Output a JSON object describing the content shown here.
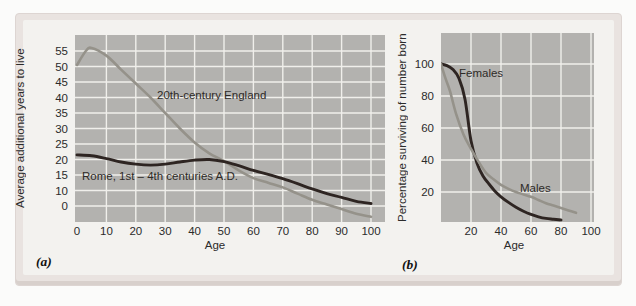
{
  "colors": {
    "plot_bg": "#b3b2af",
    "gridline": "#f0efeb",
    "frame": "#e9e3e0",
    "inner": "#f3f2ef",
    "text": "#2b2b2b",
    "dark_curve": "#2e2522",
    "light_curve": "#95928a"
  },
  "panels": [
    {
      "label": "(a)"
    },
    {
      "label": "(b)"
    }
  ],
  "chart_data": [
    {
      "type": "line",
      "panel": "a",
      "xlabel": "Age",
      "ylabel": "Average additional years to live",
      "x_ticks": [
        0,
        10,
        20,
        30,
        40,
        50,
        60,
        70,
        80,
        90,
        100
      ],
      "y_ticks": [
        55,
        50,
        45,
        40,
        35,
        30,
        25,
        20,
        15,
        10,
        0
      ],
      "xlim": [
        0,
        100
      ],
      "ylim": [
        0,
        58
      ],
      "grid": true,
      "series": [
        {
          "name": "20th-century England",
          "color": "#95928a",
          "points": [
            [
              0,
              50.5
            ],
            [
              3,
              55
            ],
            [
              5,
              56
            ],
            [
              10,
              53.5
            ],
            [
              15,
              49
            ],
            [
              20,
              44.5
            ],
            [
              25,
              40
            ],
            [
              30,
              35
            ],
            [
              35,
              30
            ],
            [
              40,
              25.5
            ],
            [
              45,
              22
            ],
            [
              50,
              19.5
            ],
            [
              55,
              16.5
            ],
            [
              60,
              14
            ],
            [
              65,
              12.5
            ],
            [
              70,
              11
            ],
            [
              75,
              9
            ],
            [
              80,
              7
            ],
            [
              85,
              5.5
            ],
            [
              90,
              4
            ],
            [
              95,
              2.5
            ],
            [
              100,
              1.5
            ]
          ]
        },
        {
          "name": "Rome, 1st – 4th centuries A.D.",
          "color": "#2e2522",
          "points": [
            [
              0,
              21.5
            ],
            [
              5,
              21.2
            ],
            [
              10,
              20.3
            ],
            [
              15,
              19.2
            ],
            [
              20,
              18.5
            ],
            [
              25,
              18.2
            ],
            [
              30,
              18.5
            ],
            [
              35,
              19.2
            ],
            [
              40,
              19.8
            ],
            [
              45,
              20
            ],
            [
              50,
              19.3
            ],
            [
              55,
              18
            ],
            [
              60,
              16.5
            ],
            [
              65,
              15.2
            ],
            [
              70,
              13.8
            ],
            [
              75,
              12.2
            ],
            [
              80,
              10.5
            ],
            [
              85,
              9
            ],
            [
              90,
              7.8
            ],
            [
              95,
              6.5
            ],
            [
              100,
              5.8
            ]
          ]
        }
      ]
    },
    {
      "type": "line",
      "panel": "b",
      "xlabel": "Age",
      "ylabel": "Percentage surviving of number born",
      "x_ticks": [
        20,
        40,
        60,
        80,
        100
      ],
      "y_ticks": [
        100,
        80,
        60,
        40,
        20
      ],
      "xlim": [
        0,
        100
      ],
      "ylim": [
        0,
        118
      ],
      "grid": true,
      "series": [
        {
          "name": "Females",
          "color": "#2e2522",
          "points": [
            [
              0,
              100
            ],
            [
              4,
              99
            ],
            [
              8,
              96.5
            ],
            [
              12,
              91
            ],
            [
              16,
              78
            ],
            [
              20,
              52
            ],
            [
              24,
              38
            ],
            [
              28,
              30
            ],
            [
              32,
              25
            ],
            [
              36,
              20.5
            ],
            [
              40,
              17
            ],
            [
              45,
              13.5
            ],
            [
              50,
              10.5
            ],
            [
              55,
              8
            ],
            [
              60,
              6
            ],
            [
              65,
              4.5
            ],
            [
              70,
              3.5
            ],
            [
              75,
              3
            ],
            [
              80,
              2.5
            ]
          ]
        },
        {
          "name": "Males",
          "color": "#95928a",
          "points": [
            [
              0,
              100
            ],
            [
              3,
              91
            ],
            [
              6,
              83
            ],
            [
              10,
              69
            ],
            [
              15,
              56
            ],
            [
              20,
              47
            ],
            [
              25,
              39
            ],
            [
              30,
              32
            ],
            [
              35,
              28
            ],
            [
              40,
              24.5
            ],
            [
              45,
              22
            ],
            [
              50,
              20
            ],
            [
              55,
              18.5
            ],
            [
              60,
              17
            ],
            [
              65,
              15
            ],
            [
              70,
              13
            ],
            [
              75,
              11.5
            ],
            [
              80,
              10
            ],
            [
              85,
              8.5
            ],
            [
              90,
              7
            ]
          ]
        }
      ]
    }
  ]
}
